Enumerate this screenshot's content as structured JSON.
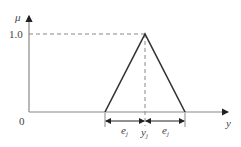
{
  "diagram": {
    "type": "triangular membership function",
    "y_axis_label": "μ",
    "x_axis_label": "y",
    "origin_label": "0",
    "peak_value_label": "1.0",
    "center_label": "y",
    "center_subscript": "j",
    "width_label": "e",
    "width_subscript": "j",
    "colors": {
      "line": "#333333",
      "axis": "#777777",
      "dash": "#777777"
    }
  }
}
